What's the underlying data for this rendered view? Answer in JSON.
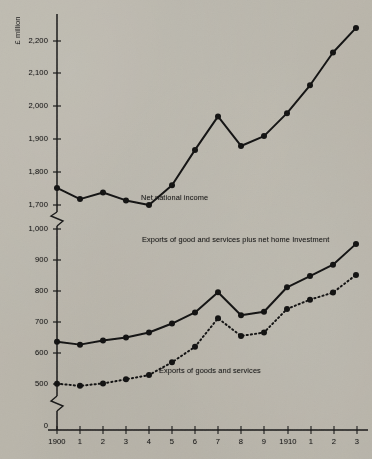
{
  "chart_data": {
    "type": "line",
    "title": "",
    "subtitle": "",
    "xlabel": "",
    "ylabel": "£ million",
    "unit_label": "£ million",
    "grid": false,
    "legend_position": "inline-annotations",
    "axis_break": true,
    "x": [
      1900,
      1901,
      1902,
      1903,
      1904,
      1905,
      1906,
      1907,
      1908,
      1909,
      1910,
      1911,
      1912,
      1913
    ],
    "xticklabels": [
      "1900",
      "1",
      "2",
      "3",
      "4",
      "5",
      "6",
      "7",
      "8",
      "9",
      "1910",
      "1",
      "2",
      "3"
    ],
    "upper_axis": {
      "ylim": [
        1700,
        2200
      ],
      "yticks": [
        1700,
        1800,
        1900,
        2000,
        2100,
        2200
      ],
      "yticklabels": [
        "1,700",
        "1,800",
        "1,900",
        "2,000",
        "2,100",
        "2,200"
      ]
    },
    "lower_axis": {
      "ylim": [
        500,
        1000
      ],
      "yticks": [
        0,
        500,
        600,
        700,
        800,
        900,
        1000
      ],
      "yticklabels": [
        "0",
        "500",
        "600",
        "700",
        "800",
        "900",
        "1,000"
      ]
    },
    "series": [
      {
        "name": "Net national income",
        "label": "Net national  income",
        "panel": "upper",
        "style": "solid",
        "marker": "filled-circle",
        "values": [
          1752,
          1718,
          1738,
          1714,
          1700,
          1760,
          1868,
          1970,
          1880,
          1910,
          1980,
          2065,
          2165,
          2240
        ]
      },
      {
        "name": "Exports of goods and services plus net home investment",
        "label": "Exports of good and  services plus net home  Investment",
        "panel": "lower",
        "style": "solid",
        "marker": "filled-circle",
        "values": [
          636,
          627,
          640,
          650,
          666,
          695,
          731,
          796,
          722,
          733,
          812,
          848,
          885,
          952
        ]
      },
      {
        "name": "Exports of goods and services",
        "label": "Exports of  goods and services",
        "panel": "lower",
        "style": "dotted",
        "marker": "filled-circle",
        "values": [
          501,
          494,
          502,
          515,
          529,
          570,
          620,
          712,
          655,
          666,
          742,
          772,
          795,
          852
        ]
      }
    ],
    "annotations": [
      {
        "text": "Net national  income",
        "series": "Net national income"
      },
      {
        "text": "Exports of good and  services plus net home  Investment",
        "series": "Exports of goods and services plus net home investment"
      },
      {
        "text": "Exports of  goods and services",
        "series": "Exports of goods and services"
      }
    ],
    "colors": {
      "ink": "#1a1a1a",
      "paper": "#cfccc4"
    }
  }
}
